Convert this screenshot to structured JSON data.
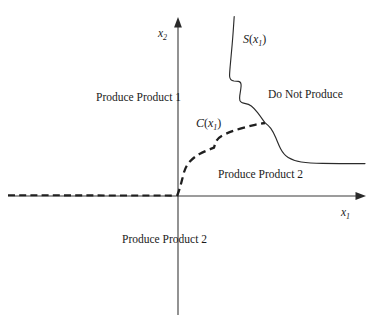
{
  "figure": {
    "background_color": "#ffffff",
    "line_color": "#2a2a2a",
    "width": 376,
    "height": 323
  },
  "axes": {
    "x_axis": {
      "label_base": "x",
      "label_sub": "1",
      "arrow": "right-arrow",
      "y_position": 196,
      "x_start": 8,
      "x_end": 365
    },
    "y_axis": {
      "label_base": "x",
      "label_sub": "2",
      "arrow": "up-arrow",
      "x_position": 178,
      "y_start": 20,
      "y_end": 315
    },
    "origin": {
      "x": 178,
      "y": 196
    }
  },
  "curves": {
    "switching_curve": {
      "name": "S",
      "label_base": "S",
      "label_sub": "1",
      "label_open": "(",
      "label_var": "x",
      "label_close": ")",
      "style": "solid",
      "label_x": 243,
      "label_y": 33
    },
    "cost_curve": {
      "name": "C",
      "label_base": "C",
      "label_sub": "1",
      "label_open": "(",
      "label_var": "x",
      "label_close": ")",
      "style": "dashed",
      "label_x": 196,
      "label_y": 117
    }
  },
  "regions": [
    {
      "id": "produce-product-1",
      "label": "Produce Product 1",
      "x": 96,
      "y": 92
    },
    {
      "id": "do-not-produce",
      "label": "Do Not Produce",
      "x": 268,
      "y": 89
    },
    {
      "id": "produce-product-2-inner",
      "label": "Produce Product 2",
      "x": 218,
      "y": 169
    },
    {
      "id": "produce-product-2-lower",
      "label": "Produce Product 2",
      "x": 122,
      "y": 234
    }
  ]
}
